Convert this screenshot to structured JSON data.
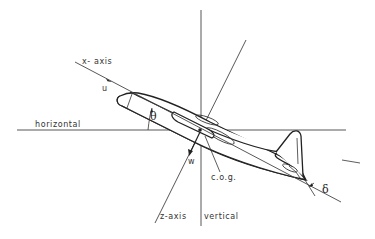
{
  "figure": {
    "type": "aircraft body axes diagram",
    "labels": {
      "x_axis": "x- axis",
      "u": "u",
      "horizontal": "horizontal",
      "theta": "θ",
      "w": "w",
      "cog": "c.o.g.",
      "z_axis": "z-axis",
      "vertical": "vertical",
      "delta": "δ"
    }
  }
}
